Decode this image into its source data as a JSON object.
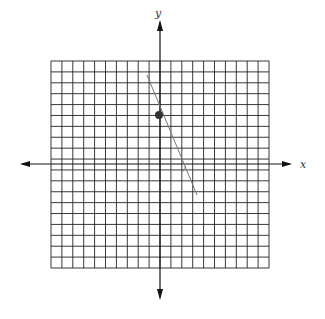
{
  "diagram": {
    "type": "coordinate-grid",
    "axes": {
      "x_label": "x",
      "y_label": "y"
    },
    "grid": {
      "columns": 20,
      "rows": 19,
      "left": 51,
      "top": 61,
      "right": 269,
      "bottom": 268
    },
    "origin_px": {
      "x": 160,
      "y": 164
    },
    "line": {
      "x1": 147,
      "y1": 75,
      "x2": 197,
      "y2": 195,
      "color": "#777777"
    },
    "point": {
      "cx": 159,
      "cy": 115,
      "r": 4,
      "color": "#333333"
    },
    "colors": {
      "grid": "#222222",
      "axis": "#111111",
      "background": "#ffffff"
    }
  }
}
